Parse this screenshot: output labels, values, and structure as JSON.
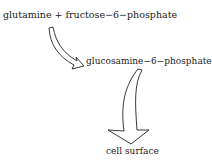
{
  "diagram": {
    "reactants": "glutamine + fructose−6−phosphate",
    "product": "glucosamine−6−phosphate",
    "destination": "cell surface",
    "arrows": [
      {
        "from": "reactants",
        "to": "product",
        "style": "hollow-curved"
      },
      {
        "from": "product",
        "to": "destination",
        "style": "hollow-curved"
      }
    ],
    "colors": {
      "stroke": "#222222",
      "background": "#ffffff"
    }
  }
}
